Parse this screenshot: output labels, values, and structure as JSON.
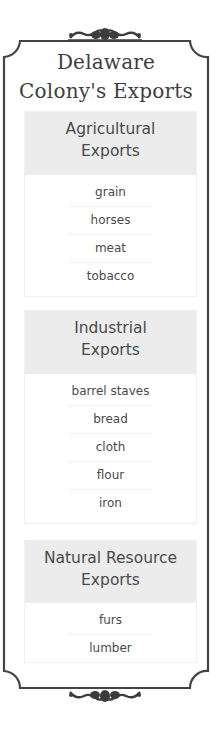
{
  "title": {
    "line1": "Delaware",
    "line2": "Colony's Exports"
  },
  "colors": {
    "frame": "#444444",
    "header_bg": "#ececec",
    "text": "#4a4a4a"
  },
  "sections": [
    {
      "header_line1": "Agricultural",
      "header_line2": "Exports",
      "items": [
        "grain",
        "horses",
        "meat",
        "tobacco"
      ]
    },
    {
      "header_line1": "Industrial",
      "header_line2": "Exports",
      "items": [
        "barrel staves",
        "bread",
        "cloth",
        "flour",
        "iron"
      ]
    },
    {
      "header_line1": "Natural Resource",
      "header_line2": "Exports",
      "items": [
        "furs",
        "lumber"
      ]
    }
  ],
  "icons": {
    "top": "ornament-flourish",
    "bottom": "ornament-flourish"
  }
}
